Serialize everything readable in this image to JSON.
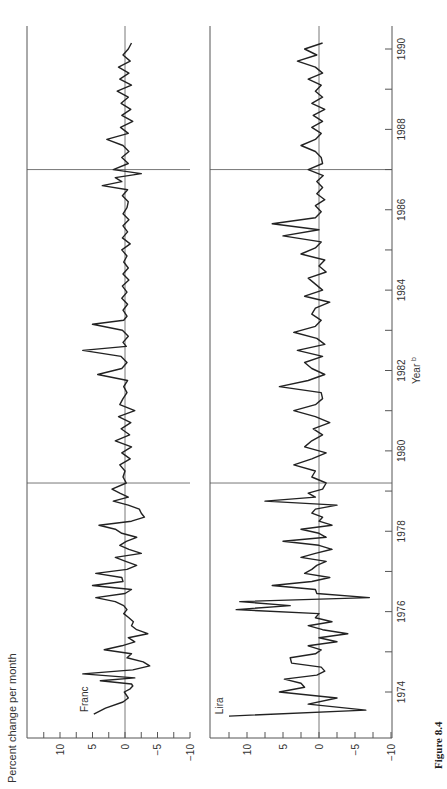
{
  "figure": {
    "caption": "Figure 8.4",
    "orientation": "rotated-90-ccw",
    "line_color": "#222222",
    "axis_color": "#555555"
  },
  "chart_data": [
    {
      "type": "line",
      "title": "Franc",
      "panel_label": "Franc",
      "xlabel": "Year",
      "xlabel_superscript": "b",
      "ylabel": "Percent change per month",
      "xlim": [
        1973.2,
        1990.5
      ],
      "ylim": [
        -10,
        15
      ],
      "x_ticks": [
        1974,
        1976,
        1978,
        1980,
        1982,
        1984,
        1986,
        1988,
        1990
      ],
      "x_minor_ticks": [
        1975,
        1977,
        1979,
        1981,
        1983,
        1985,
        1987,
        1989
      ],
      "y_ticks": [
        -10,
        -7.5,
        -5,
        -2.5,
        0,
        2.5,
        5,
        7.5,
        10,
        12.5
      ],
      "y_tick_labels": [
        "-10",
        "-5",
        "0",
        "5",
        "10"
      ],
      "reference_lines_x": [
        1979.2,
        1987.0
      ],
      "zero_line": true,
      "x": [
        1973.45,
        1973.6,
        1973.75,
        1973.85,
        1974.0,
        1974.08,
        1974.15,
        1974.2,
        1974.28,
        1974.35,
        1974.45,
        1974.55,
        1974.65,
        1974.75,
        1974.85,
        1974.95,
        1975.05,
        1975.15,
        1975.25,
        1975.35,
        1975.45,
        1975.55,
        1975.65,
        1975.75,
        1975.85,
        1975.95,
        1976.05,
        1976.15,
        1976.25,
        1976.35,
        1976.45,
        1976.55,
        1976.65,
        1976.75,
        1976.85,
        1976.95,
        1977.05,
        1977.15,
        1977.25,
        1977.35,
        1977.45,
        1977.55,
        1977.65,
        1977.75,
        1977.85,
        1977.95,
        1978.05,
        1978.15,
        1978.25,
        1978.35,
        1978.45,
        1978.55,
        1978.65,
        1978.75,
        1978.85,
        1978.95,
        1979.05,
        1979.2,
        1979.35,
        1979.5,
        1979.65,
        1979.8,
        1979.95,
        1980.1,
        1980.25,
        1980.4,
        1980.55,
        1980.7,
        1980.85,
        1981.0,
        1981.15,
        1981.3,
        1981.45,
        1981.6,
        1981.75,
        1981.9,
        1982.05,
        1982.2,
        1982.35,
        1982.5,
        1982.6,
        1982.7,
        1982.85,
        1983.0,
        1983.15,
        1983.25,
        1983.35,
        1983.5,
        1983.65,
        1983.8,
        1983.95,
        1984.1,
        1984.25,
        1984.4,
        1984.55,
        1984.7,
        1984.85,
        1985.0,
        1985.15,
        1985.3,
        1985.45,
        1985.6,
        1985.75,
        1985.9,
        1986.05,
        1986.2,
        1986.35,
        1986.5,
        1986.6,
        1986.7,
        1986.8,
        1986.9,
        1987.0,
        1987.15,
        1987.3,
        1987.45,
        1987.6,
        1987.75,
        1987.9,
        1988.05,
        1988.2,
        1988.35,
        1988.5,
        1988.65,
        1988.8,
        1988.95,
        1989.1,
        1989.25,
        1989.4,
        1989.55,
        1989.7,
        1989.85,
        1990.0,
        1990.15
      ],
      "values": [
        4.8,
        3.0,
        0.3,
        -0.5,
        0.1,
        -0.8,
        -1.2,
        -1.0,
        3.8,
        -1.5,
        6.5,
        -1.2,
        -3.8,
        -2.8,
        -0.3,
        -1.0,
        3.2,
        0.5,
        -1.5,
        -0.5,
        -3.5,
        -1.8,
        -1.0,
        -1.3,
        -0.6,
        0.2,
        -0.3,
        0.2,
        1.5,
        4.5,
        0.0,
        -1.0,
        5.0,
        0.3,
        0.5,
        4.5,
        -0.3,
        -1.8,
        -0.1,
        1.5,
        -2.5,
        -0.6,
        0.8,
        -0.2,
        -1.8,
        0.5,
        1.5,
        4.0,
        -1.0,
        -3.0,
        -2.5,
        -2.2,
        -0.5,
        1.8,
        -0.5,
        0.8,
        2.0,
        -0.2,
        0.3,
        0.0,
        0.8,
        -0.8,
        0.5,
        -1.0,
        1.5,
        -0.7,
        0.6,
        -0.9,
        1.0,
        -1.5,
        0.8,
        0.3,
        -0.3,
        0.2,
        -0.4,
        4.2,
        0.5,
        -0.3,
        0.6,
        6.5,
        -0.2,
        0.3,
        -0.5,
        0.4,
        5.0,
        0.2,
        -0.3,
        0.3,
        -0.4,
        0.5,
        -0.3,
        0.4,
        -0.6,
        0.3,
        -0.5,
        0.2,
        -0.3,
        0.5,
        -0.8,
        0.4,
        -0.4,
        0.3,
        -0.6,
        0.3,
        -0.3,
        -0.5,
        0.4,
        -0.4,
        3.5,
        0.5,
        1.5,
        -2.5,
        1.8,
        -0.5,
        0.5,
        -0.6,
        0.3,
        2.8,
        -0.5,
        0.7,
        -1.2,
        0.5,
        -0.9,
        0.6,
        -0.5,
        1.2,
        -1.0,
        0.8,
        -0.6,
        1.0,
        -0.8,
        0.3,
        -0.5,
        -1.0
      ]
    },
    {
      "type": "line",
      "title": "Lira",
      "panel_label": "Lira",
      "xlabel": "Year",
      "xlabel_superscript": "b",
      "ylabel": "Percent change per month",
      "xlim": [
        1973.2,
        1990.5
      ],
      "ylim": [
        -10,
        15
      ],
      "x_ticks": [
        1974,
        1976,
        1978,
        1980,
        1982,
        1984,
        1986,
        1988,
        1990
      ],
      "x_minor_ticks": [
        1975,
        1977,
        1979,
        1981,
        1983,
        1985,
        1987,
        1989
      ],
      "y_ticks": [
        -10,
        -7.5,
        -5,
        -2.5,
        0,
        2.5,
        5,
        7.5,
        10,
        12.5
      ],
      "y_tick_labels": [
        "-10",
        "-5",
        "0",
        "5",
        "10"
      ],
      "reference_lines_x": [
        1979.2,
        1987.0
      ],
      "zero_line": true,
      "x": [
        1973.4,
        1973.55,
        1973.7,
        1973.85,
        1974.0,
        1974.12,
        1974.22,
        1974.32,
        1974.42,
        1974.52,
        1974.62,
        1974.72,
        1974.85,
        1974.95,
        1975.05,
        1975.15,
        1975.25,
        1975.35,
        1975.45,
        1975.55,
        1975.65,
        1975.75,
        1975.85,
        1975.95,
        1976.05,
        1976.15,
        1976.25,
        1976.35,
        1976.45,
        1976.55,
        1976.65,
        1976.75,
        1976.85,
        1976.95,
        1977.05,
        1977.15,
        1977.25,
        1977.35,
        1977.45,
        1977.55,
        1977.65,
        1977.75,
        1977.85,
        1977.95,
        1978.05,
        1978.15,
        1978.25,
        1978.35,
        1978.45,
        1978.55,
        1978.65,
        1978.75,
        1978.85,
        1978.95,
        1979.05,
        1979.2,
        1979.35,
        1979.5,
        1979.65,
        1979.8,
        1979.95,
        1980.1,
        1980.25,
        1980.4,
        1980.55,
        1980.7,
        1980.85,
        1981.0,
        1981.15,
        1981.3,
        1981.45,
        1981.6,
        1981.75,
        1981.9,
        1982.05,
        1982.2,
        1982.35,
        1982.5,
        1982.65,
        1982.8,
        1982.95,
        1983.1,
        1983.25,
        1983.4,
        1983.55,
        1983.7,
        1983.85,
        1984.0,
        1984.15,
        1984.3,
        1984.45,
        1984.6,
        1984.75,
        1984.9,
        1985.05,
        1985.2,
        1985.35,
        1985.5,
        1985.65,
        1985.8,
        1985.95,
        1986.1,
        1986.25,
        1986.4,
        1986.55,
        1986.7,
        1986.85,
        1987.0,
        1987.15,
        1987.3,
        1987.45,
        1987.6,
        1987.75,
        1987.9,
        1988.05,
        1988.2,
        1988.35,
        1988.5,
        1988.65,
        1988.8,
        1988.95,
        1989.1,
        1989.25,
        1989.4,
        1989.55,
        1989.7,
        1989.85,
        1990.0,
        1990.15
      ],
      "values": [
        12.5,
        -6.5,
        1.5,
        -2.5,
        5.5,
        2.0,
        2.5,
        4.8,
        0.3,
        -0.8,
        -0.3,
        3.8,
        4.0,
        0.5,
        -0.3,
        1.5,
        -2.5,
        0.0,
        -4.0,
        -0.5,
        1.5,
        -1.8,
        0.5,
        0.0,
        11.5,
        4.0,
        11.0,
        -7.0,
        0.3,
        0.5,
        6.5,
        1.0,
        -1.5,
        2.0,
        1.0,
        0.3,
        -1.0,
        2.5,
        0.5,
        -1.8,
        0.0,
        5.0,
        -1.0,
        0.0,
        2.5,
        -1.8,
        0.0,
        -0.5,
        1.0,
        0.5,
        -2.5,
        7.5,
        0.5,
        1.5,
        -0.5,
        -1.0,
        1.0,
        0.5,
        3.5,
        1.0,
        -1.0,
        2.0,
        1.0,
        -0.5,
        0.8,
        -1.5,
        0.5,
        3.5,
        0.5,
        -0.5,
        -0.3,
        5.5,
        1.5,
        -0.8,
        1.0,
        2.0,
        -0.5,
        3.0,
        -0.8,
        0.3,
        3.5,
        0.5,
        -0.3,
        1.0,
        0.5,
        -1.5,
        2.0,
        -0.5,
        0.5,
        1.5,
        -1.0,
        0.0,
        -0.8,
        2.5,
        0.5,
        -0.3,
        5.0,
        0.0,
        6.5,
        0.5,
        -0.3,
        0.5,
        -0.8,
        0.3,
        -0.5,
        0.3,
        -0.6,
        1.5,
        -0.5,
        -0.3,
        0.5,
        2.5,
        0.5,
        -0.3,
        1.0,
        -0.5,
        0.8,
        -0.8,
        1.0,
        -0.5,
        0.5,
        -0.3,
        1.5,
        -0.5,
        0.5,
        3.0,
        0.3,
        2.0,
        -0.5,
        -0.8
      ]
    }
  ]
}
